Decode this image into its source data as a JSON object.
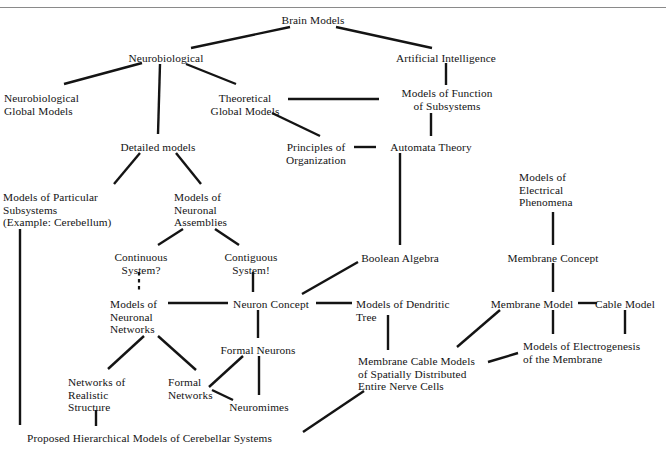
{
  "figure": {
    "width": 666,
    "height": 452,
    "background": "#ffffff",
    "ink_color": "#141414",
    "rule_color": "#8a8a8a"
  },
  "nodes": [
    {
      "id": "brain-models",
      "label": "Brain Models",
      "x": 313,
      "y": 14,
      "align": "center"
    },
    {
      "id": "neurobiological",
      "label": "Neurobiological",
      "x": 166,
      "y": 52,
      "align": "center"
    },
    {
      "id": "artificial-intelligence",
      "label": "Artificial Intelligence",
      "x": 446,
      "y": 52,
      "align": "center"
    },
    {
      "id": "neurobiological-global-models",
      "label": "Neurobiological\nGlobal Models",
      "x": 4,
      "y": 92,
      "align": "left"
    },
    {
      "id": "theoretical-global-models",
      "label": "Theoretical\nGlobal Models",
      "x": 245,
      "y": 92,
      "align": "center"
    },
    {
      "id": "models-of-function-of-subsystems",
      "label": "Models of Function\nof Subsystems",
      "x": 447,
      "y": 87,
      "align": "center"
    },
    {
      "id": "detailed-models",
      "label": "Detailed models",
      "x": 158,
      "y": 141,
      "align": "center"
    },
    {
      "id": "principles-of-organization",
      "label": "Principles of\nOrganization",
      "x": 316,
      "y": 141,
      "align": "center"
    },
    {
      "id": "automata-theory",
      "label": "Automata Theory",
      "x": 431,
      "y": 141,
      "align": "center"
    },
    {
      "id": "models-of-particular-subsystems",
      "label": "Models of Particular\nSubsystems\n(Example: Cerebellum)",
      "x": 3,
      "y": 191,
      "align": "left"
    },
    {
      "id": "models-of-neuronal-assemblies",
      "label": "Models of\nNeuronal\nAssemblies",
      "x": 174,
      "y": 191,
      "align": "left"
    },
    {
      "id": "models-of-electrical-phenomena",
      "label": "Models of\nElectrical\nPhenomena",
      "x": 519,
      "y": 171,
      "align": "left"
    },
    {
      "id": "continuous-system",
      "label": "Continuous\nSystem?",
      "x": 141,
      "y": 251,
      "align": "center"
    },
    {
      "id": "contiguous-system",
      "label": "Contiguous\nSystem!",
      "x": 251,
      "y": 251,
      "align": "center"
    },
    {
      "id": "boolean-algebra",
      "label": "Boolean Algebra",
      "x": 400,
      "y": 252,
      "align": "center"
    },
    {
      "id": "membrane-concept",
      "label": "Membrane Concept",
      "x": 553,
      "y": 252,
      "align": "center"
    },
    {
      "id": "models-of-neuronal-networks",
      "label": "Models of\nNeuronal\nNetworks",
      "x": 110,
      "y": 298,
      "align": "left"
    },
    {
      "id": "neuron-concept",
      "label": "Neuron Concept",
      "x": 271,
      "y": 298,
      "align": "center"
    },
    {
      "id": "models-of-dendritic-tree",
      "label": "Models of Dendritic\nTree",
      "x": 356,
      "y": 298,
      "align": "left"
    },
    {
      "id": "membrane-model",
      "label": "Membrane Model",
      "x": 532,
      "y": 298,
      "align": "center"
    },
    {
      "id": "cable-model",
      "label": "Cable Model",
      "x": 625,
      "y": 298,
      "align": "center"
    },
    {
      "id": "formal-neurons",
      "label": "Formal Neurons",
      "x": 258,
      "y": 344,
      "align": "center"
    },
    {
      "id": "models-of-electrogenesis",
      "label": "Models of Electrogenesis\nof the Membrane",
      "x": 523,
      "y": 340,
      "align": "left"
    },
    {
      "id": "membrane-cable-models",
      "label": "Membrane Cable Models\nof Spatially Distributed\nEntire Nerve Cells",
      "x": 358,
      "y": 355,
      "align": "left"
    },
    {
      "id": "networks-of-realistic-structure",
      "label": "Networks of\nRealistic\nStructure",
      "x": 68,
      "y": 376,
      "align": "left"
    },
    {
      "id": "formal-networks",
      "label": "Formal\nNetworks",
      "x": 168,
      "y": 376,
      "align": "left"
    },
    {
      "id": "neuromimes",
      "label": "Neuromimes",
      "x": 259,
      "y": 401,
      "align": "center"
    },
    {
      "id": "proposed-hierarchical-models",
      "label": "Proposed Hierarchical Models of Cerebellar Systems",
      "x": 27,
      "y": 432,
      "align": "left"
    }
  ],
  "edges": [
    {
      "id": "brain-models--neurobiological",
      "from": "Brain Models",
      "to": "Neurobiological",
      "x1": 290,
      "y1": 27,
      "x2": 191,
      "y2": 48,
      "style": "solid"
    },
    {
      "id": "brain-models--artificial-intelligence",
      "from": "Brain Models",
      "to": "Artificial Intelligence",
      "x1": 336,
      "y1": 27,
      "x2": 432,
      "y2": 48,
      "style": "solid"
    },
    {
      "id": "neurobiological--neurobiological-global",
      "from": "Neurobiological",
      "to": "Neurobiological Global Models",
      "x1": 142,
      "y1": 63,
      "x2": 64,
      "y2": 84,
      "style": "solid"
    },
    {
      "id": "neurobiological--detailed-models",
      "from": "Neurobiological",
      "to": "Detailed models",
      "x1": 160,
      "y1": 64,
      "x2": 158,
      "y2": 134,
      "style": "solid"
    },
    {
      "id": "neurobiological--theoretical-global",
      "from": "Neurobiological",
      "to": "Theoretical Global Models",
      "x1": 186,
      "y1": 64,
      "x2": 236,
      "y2": 84,
      "style": "solid"
    },
    {
      "id": "theoretical-global--models-of-function",
      "from": "Theoretical Global Models",
      "to": "Models of Function of Subsystems",
      "x1": 288,
      "y1": 99,
      "x2": 379,
      "y2": 99,
      "style": "solid"
    },
    {
      "id": "artificial-intelligence--models-of-function",
      "from": "Artificial Intelligence",
      "to": "Models of Function of Subsystems",
      "x1": 446,
      "y1": 63,
      "x2": 446,
      "y2": 85,
      "style": "solid"
    },
    {
      "id": "theoretical-global--principles",
      "from": "Theoretical Global Models",
      "to": "Principles of Organization",
      "x1": 272,
      "y1": 113,
      "x2": 320,
      "y2": 136,
      "style": "solid"
    },
    {
      "id": "principles--automata-theory",
      "from": "Principles of Organization",
      "to": "Automata Theory",
      "x1": 354,
      "y1": 147,
      "x2": 376,
      "y2": 147,
      "style": "solid"
    },
    {
      "id": "models-of-function--automata-theory",
      "from": "Models of Function of Subsystems",
      "to": "Automata Theory",
      "x1": 431,
      "y1": 113,
      "x2": 431,
      "y2": 136,
      "style": "solid"
    },
    {
      "id": "detailed-models--models-of-particular",
      "from": "Detailed models",
      "to": "Models of Particular Subsystems",
      "x1": 140,
      "y1": 153,
      "x2": 114,
      "y2": 184,
      "style": "solid"
    },
    {
      "id": "detailed-models--models-of-neuronal-assemblies",
      "from": "Detailed models",
      "to": "Models of Neuronal Assemblies",
      "x1": 176,
      "y1": 153,
      "x2": 201,
      "y2": 184,
      "style": "solid"
    },
    {
      "id": "models-of-particular--proposed",
      "from": "Models of Particular Subsystems",
      "to": "Proposed Hierarchical Models",
      "x1": 20,
      "y1": 229,
      "x2": 20,
      "y2": 425,
      "style": "solid"
    },
    {
      "id": "models-of-neuronal-assemblies--continuous",
      "from": "Models of Neuronal Assemblies",
      "to": "Continuous System?",
      "x1": 183,
      "y1": 229,
      "x2": 158,
      "y2": 245,
      "style": "solid"
    },
    {
      "id": "models-of-neuronal-assemblies--contiguous",
      "from": "Models of Neuronal Assemblies",
      "to": "Contiguous System!",
      "x1": 215,
      "y1": 229,
      "x2": 239,
      "y2": 245,
      "style": "solid"
    },
    {
      "id": "continuous--models-of-neuronal-networks",
      "from": "Continuous System?",
      "to": "Models of Neuronal Networks",
      "x1": 139,
      "y1": 272,
      "x2": 139,
      "y2": 292,
      "style": "dashed"
    },
    {
      "id": "contiguous--neuron-concept",
      "from": "Contiguous System!",
      "to": "Neuron Concept",
      "x1": 253,
      "y1": 272,
      "x2": 253,
      "y2": 292,
      "style": "solid"
    },
    {
      "id": "models-of-neuronal-networks--neuron-concept",
      "from": "Models of Neuronal Networks",
      "to": "Neuron Concept",
      "x1": 168,
      "y1": 303,
      "x2": 228,
      "y2": 303,
      "style": "solid"
    },
    {
      "id": "neuron-concept--boolean-algebra",
      "from": "Neuron Concept",
      "to": "Boolean Algebra",
      "x1": 302,
      "y1": 294,
      "x2": 358,
      "y2": 262,
      "style": "solid"
    },
    {
      "id": "automata-theory--boolean-algebra",
      "from": "Automata Theory",
      "to": "Boolean Algebra",
      "x1": 400,
      "y1": 153,
      "x2": 400,
      "y2": 245,
      "style": "solid"
    },
    {
      "id": "neuron-concept--models-of-dendritic-tree",
      "from": "Neuron Concept",
      "to": "Models of Dendritic Tree",
      "x1": 316,
      "y1": 303,
      "x2": 352,
      "y2": 303,
      "style": "solid"
    },
    {
      "id": "models-of-electrical--membrane-concept",
      "from": "Models of Electrical Phenomena",
      "to": "Membrane Concept",
      "x1": 553,
      "y1": 212,
      "x2": 553,
      "y2": 245,
      "style": "solid"
    },
    {
      "id": "membrane-concept--membrane-model",
      "from": "Membrane Concept",
      "to": "Membrane Model",
      "x1": 553,
      "y1": 263,
      "x2": 553,
      "y2": 292,
      "style": "solid"
    },
    {
      "id": "membrane-model--cable-model",
      "from": "Membrane Model",
      "to": "Cable Model",
      "x1": 578,
      "y1": 303,
      "x2": 597,
      "y2": 303,
      "style": "solid"
    },
    {
      "id": "membrane-model--models-of-electrogenesis",
      "from": "Membrane Model",
      "to": "Models of Electrogenesis of the Membrane",
      "x1": 553,
      "y1": 310,
      "x2": 553,
      "y2": 334,
      "style": "solid"
    },
    {
      "id": "cable-model--models-of-electrogenesis",
      "from": "Cable Model",
      "to": "Models of Electrogenesis of the Membrane",
      "x1": 625,
      "y1": 310,
      "x2": 625,
      "y2": 334,
      "style": "solid"
    },
    {
      "id": "models-of-dendritic-tree--membrane-cable",
      "from": "Models of Dendritic Tree",
      "to": "Membrane Cable Models",
      "x1": 388,
      "y1": 315,
      "x2": 388,
      "y2": 350,
      "style": "solid"
    },
    {
      "id": "membrane-model--membrane-cable",
      "from": "Membrane Model",
      "to": "Membrane Cable Models",
      "x1": 500,
      "y1": 310,
      "x2": 457,
      "y2": 347,
      "style": "solid"
    },
    {
      "id": "models-of-electrogenesis--membrane-cable",
      "from": "Models of Electrogenesis of the Membrane",
      "to": "Membrane Cable Models",
      "x1": 518,
      "y1": 353,
      "x2": 488,
      "y2": 362,
      "style": "solid"
    },
    {
      "id": "neuron-concept--formal-neurons",
      "from": "Neuron Concept",
      "to": "Formal Neurons",
      "x1": 258,
      "y1": 310,
      "x2": 258,
      "y2": 338,
      "style": "solid"
    },
    {
      "id": "formal-neurons--neuromimes",
      "from": "Formal Neurons",
      "to": "Neuromimes",
      "x1": 259,
      "y1": 356,
      "x2": 259,
      "y2": 395,
      "style": "solid"
    },
    {
      "id": "formal-neurons--formal-networks",
      "from": "Formal Neurons",
      "to": "Formal Networks",
      "x1": 243,
      "y1": 356,
      "x2": 209,
      "y2": 387,
      "style": "solid"
    },
    {
      "id": "models-of-neuronal-networks--networks-of-realistic",
      "from": "Models of Neuronal Networks",
      "to": "Networks of Realistic Structure",
      "x1": 144,
      "y1": 336,
      "x2": 108,
      "y2": 369,
      "style": "solid"
    },
    {
      "id": "models-of-neuronal-networks--formal-networks",
      "from": "Models of Neuronal Networks",
      "to": "Formal Networks",
      "x1": 158,
      "y1": 336,
      "x2": 196,
      "y2": 370,
      "style": "solid"
    },
    {
      "id": "formal-networks--neuromimes",
      "from": "Formal Networks",
      "to": "Neuromimes",
      "x1": 212,
      "y1": 390,
      "x2": 233,
      "y2": 400,
      "style": "solid"
    },
    {
      "id": "networks-of-realistic--proposed",
      "from": "Networks of Realistic Structure",
      "to": "Proposed Hierarchical Models",
      "x1": 96,
      "y1": 410,
      "x2": 96,
      "y2": 426,
      "style": "solid"
    },
    {
      "id": "membrane-cable--proposed",
      "from": "Membrane Cable Models",
      "to": "Proposed Hierarchical Models",
      "x1": 364,
      "y1": 391,
      "x2": 303,
      "y2": 432,
      "style": "solid"
    }
  ]
}
